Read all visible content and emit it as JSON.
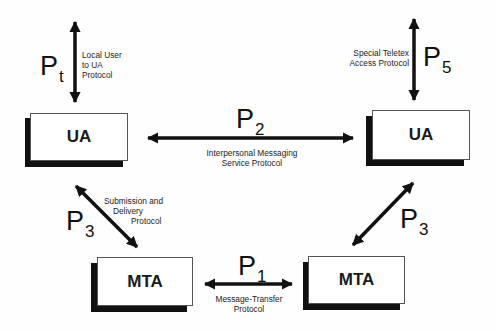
{
  "diagram": {
    "nodes": {
      "ua_left": {
        "label": "UA"
      },
      "ua_right": {
        "label": "UA"
      },
      "mta_left": {
        "label": "MTA"
      },
      "mta_right": {
        "label": "MTA"
      }
    },
    "protocols": {
      "pt": {
        "symbol": "P",
        "subscript": "t",
        "description": [
          "Local User",
          "to UA",
          "Protocol"
        ]
      },
      "p5": {
        "symbol": "P",
        "subscript": "5",
        "description": [
          "Special Teletex",
          "Access Protocol"
        ]
      },
      "p2": {
        "symbol": "P",
        "subscript": "2",
        "description": [
          "Interpersonal Messaging",
          "Service Protocol"
        ]
      },
      "p3_left": {
        "symbol": "P",
        "subscript": "3",
        "description": [
          "Submission and",
          "Delivery",
          "Protocol"
        ]
      },
      "p3_right": {
        "symbol": "P",
        "subscript": "3"
      },
      "p1": {
        "symbol": "P",
        "subscript": "1",
        "description": [
          "Message-Transfer",
          "Protocol"
        ]
      }
    },
    "colors": {
      "arrow": "#111111",
      "shadow": "#111111",
      "box_fill": "#ffffff",
      "box_border": "#555555"
    }
  }
}
